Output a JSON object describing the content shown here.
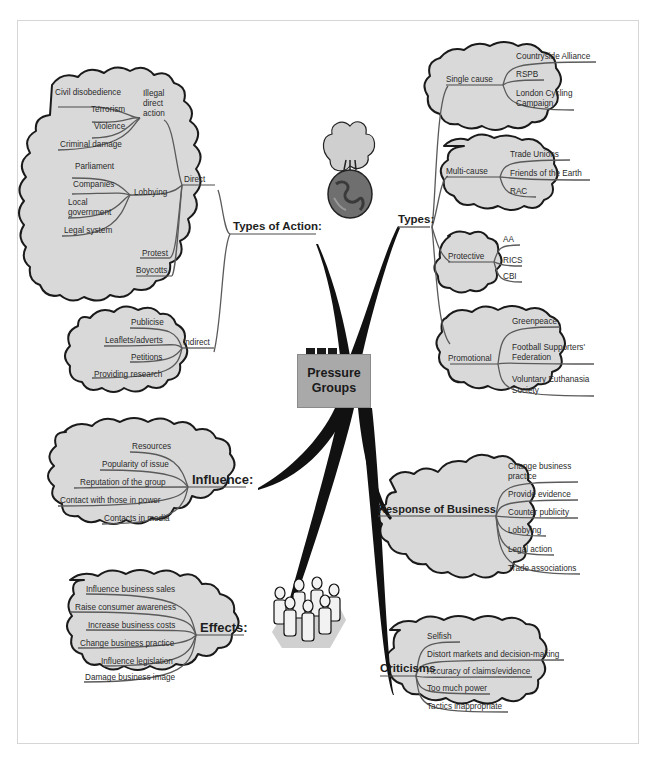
{
  "title": "Pressure Groups",
  "center": {
    "line1": "Pressure",
    "line2": "Groups"
  },
  "colors": {
    "cloud_fill": "#d9d9d9",
    "cloud_stroke": "#1a1a1a",
    "center_fill": "#a9a9a9",
    "branch": "#111111",
    "twig": "#555555"
  },
  "icons": {
    "top": "burning-globe-icon",
    "bottom": "crowd-of-people-icon"
  },
  "types_of_action": {
    "label": "Types of Action:",
    "direct": {
      "label": "Direct",
      "illegal": {
        "label_1": "Illegal",
        "label_2": "direct",
        "label_3": "action",
        "items": [
          "Civil disobedience",
          "Terrorism",
          "Violence",
          "Criminal damage"
        ]
      },
      "lobbying": {
        "label": "Lobbying",
        "items": [
          "Parliament",
          "Companies",
          "Local",
          "government",
          "Legal system"
        ]
      },
      "protest": "Protest",
      "boycotts": "Boycotts"
    },
    "indirect": {
      "label": "Indirect",
      "items": [
        "Publicise",
        "Leaflets/adverts",
        "Petitions",
        "Providing research"
      ]
    }
  },
  "types": {
    "label": "Types:",
    "single_cause": {
      "label": "Single cause",
      "items": [
        "Countryside Alliance",
        "RSPB",
        "London Cycling",
        "Campaign"
      ]
    },
    "multi_cause": {
      "label": "Multi-cause",
      "items": [
        "Trade Unions",
        "Friends of the Earth",
        "RAC"
      ]
    },
    "protective": {
      "label": "Protective",
      "items": [
        "AA",
        "RICS",
        "CBI"
      ]
    },
    "promotional": {
      "label": "Promotional",
      "items": [
        "Greenpeace",
        "Football Supporters'",
        "Federation",
        "Voluntary Euthanasia",
        "Society"
      ]
    }
  },
  "influence": {
    "label": "Influence:",
    "items": [
      "Resources",
      "Popularity of issue",
      "Reputation of the group",
      "Contact with those in power",
      "Contacts in media"
    ]
  },
  "response_of_business": {
    "label": "Response of Business",
    "items": [
      "Change business",
      "practice",
      "Provide evidence",
      "Counter publicity",
      "Lobbying",
      "Legal action",
      "Trade associations"
    ]
  },
  "effects": {
    "label": "Effects:",
    "items": [
      "Influence business sales",
      "Raise consumer awareness",
      "Increase business costs",
      "Change business practice",
      "Influence legislation",
      "Damage business image"
    ]
  },
  "criticisms": {
    "label": "Criticisms",
    "items": [
      "Selfish",
      "Distort markets and decision-making",
      "Accuracy of claims/evidence",
      "Too much power",
      "Tactics inappropriate"
    ]
  }
}
